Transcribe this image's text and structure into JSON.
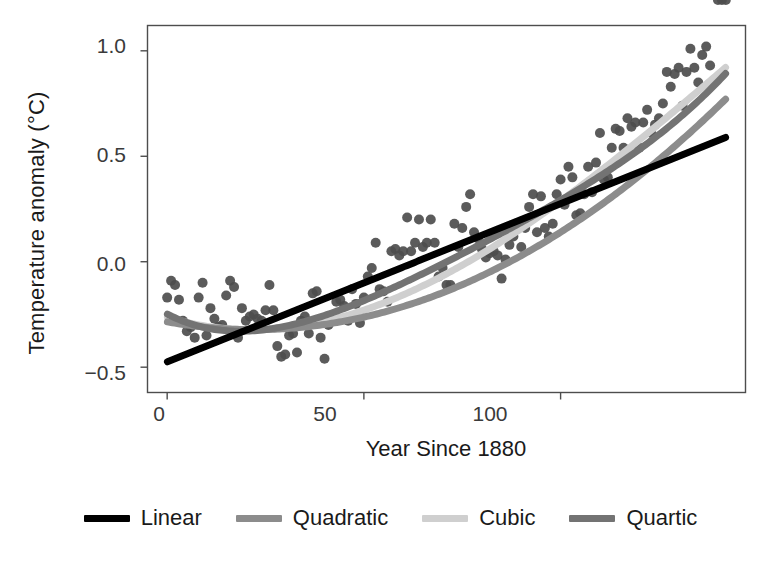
{
  "chart_data": {
    "type": "scatter",
    "title": "",
    "xlabel": "Year Since 1880",
    "ylabel": "Temperature anomaly (°C)",
    "xlim": [
      -5,
      147
    ],
    "ylim": [
      -0.62,
      1.12
    ],
    "xticks": [
      0,
      50,
      100
    ],
    "xtick_labels": [
      "0",
      "50",
      "100"
    ],
    "yticks": [
      -0.5,
      0.0,
      0.5,
      1.0
    ],
    "ytick_labels": [
      "−0.5",
      "0.0",
      "0.5",
      "1.0"
    ],
    "grid": false,
    "legend_position": "bottom",
    "point_color": "#4d4d4d",
    "point_radius": 5,
    "panel_border_color": "#4d4d4d",
    "scatter": {
      "name": "Global temperature anomaly",
      "x": [
        0,
        1,
        2,
        3,
        4,
        5,
        6,
        7,
        8,
        9,
        10,
        11,
        12,
        13,
        14,
        15,
        16,
        17,
        18,
        19,
        20,
        21,
        22,
        23,
        24,
        25,
        26,
        27,
        28,
        29,
        30,
        31,
        32,
        33,
        34,
        35,
        36,
        37,
        38,
        39,
        40,
        41,
        42,
        43,
        44,
        45,
        46,
        47,
        48,
        49,
        50,
        51,
        52,
        53,
        54,
        55,
        56,
        57,
        58,
        59,
        60,
        61,
        62,
        63,
        64,
        65,
        66,
        67,
        68,
        69,
        70,
        71,
        72,
        73,
        74,
        75,
        76,
        77,
        78,
        79,
        80,
        81,
        82,
        83,
        84,
        85,
        86,
        87,
        88,
        89,
        90,
        91,
        92,
        93,
        94,
        95,
        96,
        97,
        98,
        99,
        100,
        101,
        102,
        103,
        104,
        105,
        106,
        107,
        108,
        109,
        110,
        111,
        112,
        113,
        114,
        115,
        116,
        117,
        118,
        119,
        120,
        121,
        122,
        123,
        124,
        125,
        126,
        127,
        128,
        129,
        130,
        131,
        132,
        133,
        134,
        135,
        136,
        137,
        138,
        139,
        140,
        141,
        142
      ],
      "y": [
        -0.17,
        -0.09,
        -0.11,
        -0.18,
        -0.28,
        -0.33,
        -0.31,
        -0.36,
        -0.17,
        -0.1,
        -0.35,
        -0.22,
        -0.27,
        -0.31,
        -0.3,
        -0.16,
        -0.09,
        -0.12,
        -0.36,
        -0.22,
        -0.28,
        -0.26,
        -0.25,
        -0.27,
        -0.28,
        -0.23,
        -0.11,
        -0.23,
        -0.4,
        -0.45,
        -0.44,
        -0.35,
        -0.34,
        -0.43,
        -0.28,
        -0.26,
        -0.34,
        -0.15,
        -0.14,
        -0.36,
        -0.46,
        -0.3,
        -0.28,
        -0.19,
        -0.18,
        -0.21,
        -0.28,
        -0.13,
        -0.2,
        -0.29,
        -0.17,
        -0.07,
        -0.03,
        0.09,
        -0.13,
        -0.14,
        -0.19,
        0.05,
        0.06,
        0.03,
        0.05,
        0.21,
        0.05,
        0.09,
        0.2,
        0.07,
        0.09,
        0.2,
        0.09,
        -0.07,
        -0.03,
        -0.11,
        -0.11,
        0.18,
        0.07,
        0.16,
        0.26,
        0.32,
        0.14,
        0.11,
        0.06,
        0.02,
        0.04,
        0.05,
        0.03,
        -0.08,
        0.01,
        0.08,
        0.12,
        0.18,
        0.07,
        0.16,
        0.26,
        0.32,
        0.14,
        0.31,
        0.16,
        0.12,
        0.18,
        0.32,
        0.39,
        0.27,
        0.45,
        0.4,
        0.22,
        0.23,
        0.32,
        0.45,
        0.33,
        0.47,
        0.61,
        0.39,
        0.4,
        0.54,
        0.63,
        0.62,
        0.54,
        0.68,
        0.64,
        0.66,
        0.54,
        0.66,
        0.72,
        0.61,
        0.65,
        0.68,
        0.75,
        0.9,
        0.83,
        0.89,
        0.92,
        0.74,
        0.9,
        1.01,
        0.92,
        0.85,
        0.98,
        1.02,
        0.93,
        0.85
      ]
    },
    "series": [
      {
        "name": "Linear",
        "type": "line",
        "color": "#000000",
        "width": 7,
        "order": 1,
        "coefficients": [
          -0.475,
          0.0075
        ],
        "label": "Linear"
      },
      {
        "name": "Quadratic",
        "type": "line",
        "color": "#8c8c8c",
        "width": 7,
        "order": 2,
        "coefficients": [
          -0.285,
          -0.00335,
          7.6e-05
        ],
        "label": "Quadratic"
      },
      {
        "name": "Cubic",
        "type": "line",
        "color": "#cfcfcf",
        "width": 7,
        "order": 3,
        "coefficients": [
          -0.262,
          -0.0058,
          0.000145,
          -3.2e-07
        ],
        "label": "Cubic"
      },
      {
        "name": "Quartic",
        "type": "line",
        "color": "#737373",
        "width": 7,
        "order": 4,
        "coefficients": [
          -0.248,
          -0.0096,
          0.000325,
          -2.55e-06,
          8e-09
        ],
        "label": "Quartic"
      }
    ]
  },
  "legend": {
    "items": [
      {
        "label": "Linear",
        "color": "#000000"
      },
      {
        "label": "Quadratic",
        "color": "#8c8c8c"
      },
      {
        "label": "Cubic",
        "color": "#cfcfcf"
      },
      {
        "label": "Quartic",
        "color": "#737373"
      }
    ]
  },
  "axes": {
    "x_title": "Year Since 1880",
    "y_title": "Temperature anomaly (°C)",
    "x_tick_labels": [
      "0",
      "50",
      "100"
    ],
    "y_tick_labels": [
      "1.0",
      "0.5",
      "0.0",
      "−0.5"
    ]
  }
}
